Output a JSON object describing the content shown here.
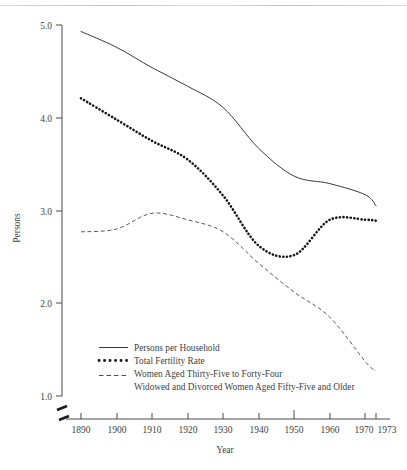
{
  "chart_data": {
    "type": "line",
    "title": "",
    "xlabel": "Year",
    "ylabel": "Persons",
    "xlim": [
      1885,
      1976
    ],
    "ylim": [
      1.0,
      5.0
    ],
    "grid": false,
    "legend_position": "lower-left-inside",
    "axis_break": true,
    "x_ticks": [
      {
        "value": 1890,
        "label": "1890"
      },
      {
        "value": 1900,
        "label": "1900"
      },
      {
        "value": 1910,
        "label": "1910"
      },
      {
        "value": 1920,
        "label": "1920"
      },
      {
        "value": 1930,
        "label": "1930"
      },
      {
        "value": 1940,
        "label": "1940"
      },
      {
        "value": 1950,
        "label": "1950"
      },
      {
        "value": 1960,
        "label": "1960"
      },
      {
        "value": 1970,
        "label": "1970"
      },
      {
        "value": 1973,
        "label": "1973"
      }
    ],
    "y_ticks": [
      {
        "value": 5.0,
        "label": "5.0"
      },
      {
        "value": 4.0,
        "label": "4.0"
      },
      {
        "value": 3.0,
        "label": "3.0"
      },
      {
        "value": 2.0,
        "label": "2.0"
      },
      {
        "value": 1.0,
        "label": "1.0"
      }
    ],
    "x": [
      1890,
      1900,
      1910,
      1920,
      1930,
      1940,
      1950,
      1960,
      1970,
      1973
    ],
    "series": [
      {
        "name": "Persons per Household",
        "style": "solid",
        "values": [
          4.93,
          4.76,
          4.54,
          4.34,
          4.11,
          3.67,
          3.37,
          3.29,
          3.17,
          3.05
        ]
      },
      {
        "name": "Total Fertility Rate",
        "style": "dotted",
        "values": [
          4.21,
          3.98,
          3.75,
          3.55,
          3.16,
          2.62,
          2.52,
          2.9,
          2.9,
          2.89
        ]
      },
      {
        "name": "Women Aged Thirty-Five to Forty-Four",
        "style": "dashed",
        "values": [
          2.77,
          2.8,
          2.97,
          2.9,
          2.77,
          2.43,
          2.12,
          1.85,
          1.37,
          1.27
        ]
      }
    ],
    "legend": [
      {
        "label": "Persons per Household",
        "style": "solid"
      },
      {
        "label": "Total Fertility Rate",
        "style": "dotted"
      },
      {
        "label": "Women Aged Thirty-Five to Forty-Four",
        "style": "dashed"
      },
      {
        "label": "Widowed and Divorced Women Aged Fifty-Five and Older",
        "style": "none"
      }
    ]
  },
  "axes": {
    "y_title": "Persons",
    "x_title": "Year",
    "y_tick_labels": [
      "5.0",
      "4.0",
      "3.0",
      "2.0",
      "1.0"
    ],
    "x_tick_labels": [
      "1890",
      "1900",
      "1910",
      "1920",
      "1930",
      "1940",
      "1950",
      "1960",
      "1970",
      "1973"
    ]
  },
  "legend": {
    "items": [
      {
        "label": "Persons per Household"
      },
      {
        "label": "Total Fertility Rate"
      },
      {
        "label": "Women Aged Thirty-Five to Forty-Four"
      },
      {
        "label": "Widowed and Divorced Women Aged Fifty-Five and Older"
      }
    ]
  }
}
